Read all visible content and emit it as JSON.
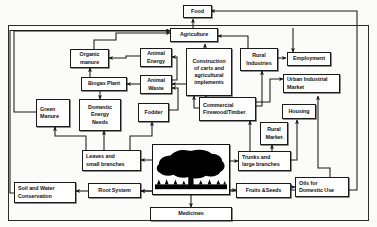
{
  "diagram": {
    "type": "flow-diagram",
    "style": {
      "line_color": "#1a1a1a",
      "box_fill": "#ffffff",
      "background": "#fbfbfa",
      "tree_silhouette_color": "#000000"
    },
    "nodes": [
      {
        "id": "food",
        "label": "Food"
      },
      {
        "id": "agriculture",
        "label": "Agriculture"
      },
      {
        "id": "organic_manure",
        "label": "Organic\nmanure"
      },
      {
        "id": "animal_energy",
        "label": "Animal\nEnergy"
      },
      {
        "id": "construction",
        "label": "Construction\nof carts and\nagricultural\nimplements"
      },
      {
        "id": "rural_industries",
        "label": "Rural\nIndustries"
      },
      {
        "id": "employment",
        "label": "Employment"
      },
      {
        "id": "biogas_plant",
        "label": "Biogas Plant"
      },
      {
        "id": "animal_waste",
        "label": "Animal\nWaste"
      },
      {
        "id": "urban_industrial_market",
        "label": "Urban Industrial\nMarket"
      },
      {
        "id": "green_manure",
        "label": "Green\nManure"
      },
      {
        "id": "domestic_energy_needs",
        "label": "Domestic\nEnergy\nNeeds"
      },
      {
        "id": "fodder",
        "label": "Fodder"
      },
      {
        "id": "commercial_firewood",
        "label": "Commercial\nFirewood/Timber"
      },
      {
        "id": "housing",
        "label": "Housing"
      },
      {
        "id": "rural_market",
        "label": "Rural\nMarket"
      },
      {
        "id": "leaves",
        "label": "Leaves and\nsmall branches"
      },
      {
        "id": "tree",
        "label": ""
      },
      {
        "id": "trunks",
        "label": "Trunks and\nlarge branches"
      },
      {
        "id": "oils",
        "label": "Oils  for\nDomestic  Use"
      },
      {
        "id": "soil_water",
        "label": "Soil and Water\nConservation"
      },
      {
        "id": "root_system",
        "label": "Root System"
      },
      {
        "id": "fruits_seeds",
        "label": "Fruits &Seeds"
      },
      {
        "id": "medicines",
        "label": "Medicines"
      }
    ],
    "edges": [
      {
        "from": "agriculture",
        "to": "food"
      },
      {
        "from": "food",
        "to": "agriculture"
      },
      {
        "from": "organic_manure",
        "to": "agriculture"
      },
      {
        "from": "green_manure",
        "to": "agriculture"
      },
      {
        "from": "construction",
        "to": "agriculture"
      },
      {
        "from": "rural_industries",
        "to": "agriculture"
      },
      {
        "from": "animal_energy",
        "to": "organic_manure"
      },
      {
        "from": "animal_waste",
        "to": "animal_energy"
      },
      {
        "from": "animal_waste",
        "to": "biogas_plant"
      },
      {
        "from": "biogas_plant",
        "to": "organic_manure"
      },
      {
        "from": "biogas_plant",
        "to": "domestic_energy_needs"
      },
      {
        "from": "fodder",
        "to": "animal_waste"
      },
      {
        "from": "leaves",
        "to": "domestic_energy_needs"
      },
      {
        "from": "leaves",
        "to": "green_manure"
      },
      {
        "from": "leaves",
        "to": "fodder"
      },
      {
        "from": "tree",
        "to": "leaves"
      },
      {
        "from": "tree",
        "to": "trunks"
      },
      {
        "from": "tree",
        "to": "root_system"
      },
      {
        "from": "tree",
        "to": "medicines"
      },
      {
        "from": "root_system",
        "to": "soil_water"
      },
      {
        "from": "fruits_seeds",
        "to": "root_system"
      },
      {
        "from": "fruits_seeds",
        "to": "oils"
      },
      {
        "from": "fruits_seeds",
        "to": "food"
      },
      {
        "from": "trunks",
        "to": "commercial_firewood"
      },
      {
        "from": "trunks",
        "to": "rural_market"
      },
      {
        "from": "trunks",
        "to": "housing"
      },
      {
        "from": "commercial_firewood",
        "to": "construction"
      },
      {
        "from": "commercial_firewood",
        "to": "rural_industries"
      },
      {
        "from": "commercial_firewood",
        "to": "urban_industrial_market"
      },
      {
        "from": "rural_industries",
        "to": "employment"
      },
      {
        "from": "oils",
        "to": "urban_industrial_market"
      },
      {
        "from": "soil_water",
        "to": "agriculture"
      }
    ]
  }
}
